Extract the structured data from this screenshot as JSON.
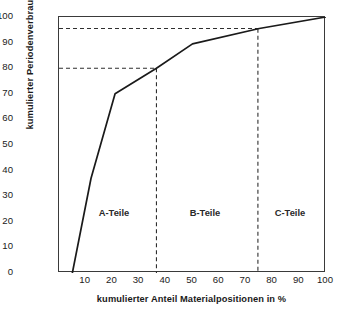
{
  "chart_data": {
    "type": "line",
    "title": "",
    "subtitle": "",
    "xlabel": "kumulierter Anteil Materialpositionen in %",
    "ylabel": "kumulierter Periodenverbrauch in %",
    "xlim": [
      0,
      100
    ],
    "ylim": [
      0,
      100
    ],
    "grid": false,
    "legend": null,
    "xticks": [
      10,
      20,
      30,
      40,
      50,
      60,
      70,
      80,
      90,
      100
    ],
    "yticks": [
      0,
      10,
      20,
      30,
      40,
      50,
      60,
      70,
      80,
      90,
      100
    ],
    "series": [
      {
        "name": "Lorenzkurve",
        "color": "#1a1a1a",
        "x": [
          5,
          12,
          21,
          36.5,
          50,
          75,
          100
        ],
        "y": [
          0,
          37,
          70,
          80,
          89.5,
          95.5,
          100
        ]
      }
    ],
    "reference_lines": [
      {
        "name": "a-b-divider",
        "orientation": "vertical",
        "value": 36.5,
        "style": "dashed"
      },
      {
        "name": "b-c-divider",
        "orientation": "vertical",
        "value": 74.5,
        "style": "dashed"
      },
      {
        "name": "a-threshold",
        "orientation": "horizontal",
        "value": 80,
        "from": 0,
        "to": 36.5,
        "style": "dashed"
      },
      {
        "name": "b-threshold",
        "orientation": "horizontal",
        "value": 95.5,
        "from": 0,
        "to": 74.5,
        "style": "dashed"
      }
    ],
    "annotations": [
      {
        "name": "segment-a",
        "label": "A-Teile",
        "x": 21,
        "y": 24
      },
      {
        "name": "segment-b",
        "label": "B-Teile",
        "x": 55,
        "y": 24
      },
      {
        "name": "segment-c",
        "label": "C-Teile",
        "x": 87,
        "y": 24
      }
    ]
  },
  "axes": {
    "x_title": "kumulierter Anteil Materialpositionen in %",
    "y_title": "kumulierter Periodenverbrauch in %",
    "x_tick_labels": [
      "10",
      "20",
      "30",
      "40",
      "50",
      "60",
      "70",
      "80",
      "90",
      "100"
    ],
    "y_tick_labels": [
      "0",
      "10",
      "20",
      "30",
      "40",
      "50",
      "60",
      "70",
      "80",
      "90",
      "100"
    ]
  },
  "segments": [
    {
      "label": "A-Teile"
    },
    {
      "label": "B-Teile"
    },
    {
      "label": "C-Teile"
    }
  ],
  "colors": {
    "background": "#ffffff",
    "curve": "#1a1a1a",
    "frame": "#3a3a3a",
    "dashed": "#2f2f2f",
    "text": "#1a1a1a"
  }
}
